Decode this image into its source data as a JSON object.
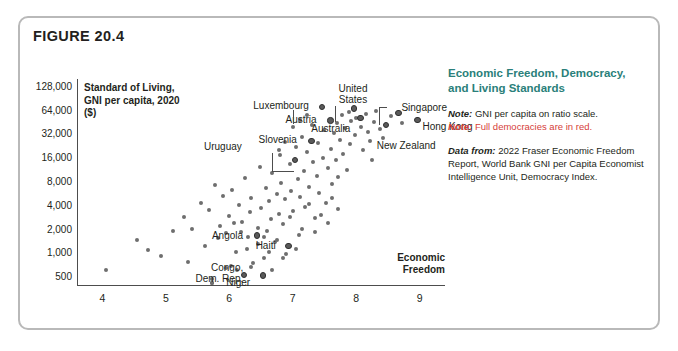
{
  "figure": {
    "label": "FIGURE 20.4"
  },
  "side_panel": {
    "heading": "Economic Freedom, Democracy, and Living Standards",
    "note1_prefix": "Note:",
    "note1_text": " GNI per capita on ratio scale.",
    "note2_prefix": "Note:",
    "note2_text": " Full democracies are in red.",
    "source_prefix": "Data from:",
    "source_text": " 2022 Fraser Economic Freedom Report, World Bank GNI per Capita Economist Intelligence Unit, Democracy Index.",
    "heading_color": "#2a7f7a",
    "red_color": "#d6403a"
  },
  "chart_data": {
    "type": "scatter",
    "title": "Economic Freedom, Democracy, and Living Standards",
    "xlabel": "Economic Freedom",
    "ylabel": "Standard of Living, GNI per capita, 2020 ($)",
    "xlim": [
      3.6,
      9.4
    ],
    "ylim": [
      400,
      160000
    ],
    "yscale": "log",
    "grid": false,
    "legend": null,
    "xticks": [
      4,
      5,
      6,
      7,
      8,
      9
    ],
    "xtick_labels": [
      "4",
      "5",
      "6",
      "7",
      "8",
      "9"
    ],
    "yticks": [
      500,
      1000,
      2000,
      4000,
      8000,
      16000,
      32000,
      64000,
      128000
    ],
    "ytick_labels": [
      "500",
      "1,000",
      "2,000",
      "4,000",
      "8,000",
      "16,000",
      "32,000",
      "64,000",
      "128,000"
    ],
    "point_color": "#6e6e6e",
    "highlight_color": "#2f2f2f",
    "annotations": [
      {
        "label": "Luxembourg",
        "x": 7.45,
        "y": 73000
      },
      {
        "label": "United States",
        "x": 7.95,
        "y": 70000
      },
      {
        "label": "Singapore",
        "x": 8.65,
        "y": 61000
      },
      {
        "label": "Austria",
        "x": 7.58,
        "y": 49000
      },
      {
        "label": "Slovenia",
        "x": 7.28,
        "y": 27000
      },
      {
        "label": "Australia",
        "x": 8.05,
        "y": 53000
      },
      {
        "label": "Hong Kong",
        "x": 8.95,
        "y": 50000
      },
      {
        "label": "Uruguay",
        "x": 7.02,
        "y": 15500
      },
      {
        "label": "New Zealand",
        "x": 8.45,
        "y": 43000
      },
      {
        "label": "Angola",
        "x": 6.42,
        "y": 1740
      },
      {
        "label": "Haiti",
        "x": 6.92,
        "y": 1280
      },
      {
        "label": "Congo, Dem. Rep.",
        "x": 6.22,
        "y": 550
      },
      {
        "label": "Niger",
        "x": 6.52,
        "y": 540
      }
    ],
    "points": [
      {
        "x": 4.05,
        "y": 620
      },
      {
        "x": 4.55,
        "y": 1500
      },
      {
        "x": 4.92,
        "y": 930
      },
      {
        "x": 5.28,
        "y": 2900
      },
      {
        "x": 5.42,
        "y": 2050
      },
      {
        "x": 5.55,
        "y": 4400
      },
      {
        "x": 5.62,
        "y": 1250
      },
      {
        "x": 5.68,
        "y": 3500
      },
      {
        "x": 5.72,
        "y": 430
      },
      {
        "x": 5.78,
        "y": 7400
      },
      {
        "x": 5.85,
        "y": 2250
      },
      {
        "x": 5.9,
        "y": 5400
      },
      {
        "x": 5.95,
        "y": 1800
      },
      {
        "x": 6.0,
        "y": 3000
      },
      {
        "x": 6.05,
        "y": 6300
      },
      {
        "x": 6.1,
        "y": 1050
      },
      {
        "x": 6.15,
        "y": 4100
      },
      {
        "x": 6.2,
        "y": 2500
      },
      {
        "x": 6.25,
        "y": 9000
      },
      {
        "x": 6.3,
        "y": 1600
      },
      {
        "x": 6.32,
        "y": 3300
      },
      {
        "x": 6.35,
        "y": 5000
      },
      {
        "x": 6.38,
        "y": 760
      },
      {
        "x": 6.45,
        "y": 2100
      },
      {
        "x": 6.48,
        "y": 12500
      },
      {
        "x": 6.5,
        "y": 3800
      },
      {
        "x": 6.55,
        "y": 880
      },
      {
        "x": 6.58,
        "y": 6800
      },
      {
        "x": 6.6,
        "y": 1950
      },
      {
        "x": 6.62,
        "y": 4600
      },
      {
        "x": 6.65,
        "y": 2700
      },
      {
        "x": 6.68,
        "y": 10500
      },
      {
        "x": 6.72,
        "y": 1400
      },
      {
        "x": 6.75,
        "y": 5600
      },
      {
        "x": 6.78,
        "y": 3200
      },
      {
        "x": 6.8,
        "y": 17500
      },
      {
        "x": 6.82,
        "y": 7800
      },
      {
        "x": 6.85,
        "y": 2350
      },
      {
        "x": 6.88,
        "y": 4900
      },
      {
        "x": 6.9,
        "y": 990
      },
      {
        "x": 6.95,
        "y": 13500
      },
      {
        "x": 6.98,
        "y": 6100
      },
      {
        "x": 7.0,
        "y": 3400
      },
      {
        "x": 7.05,
        "y": 22000
      },
      {
        "x": 7.08,
        "y": 8800
      },
      {
        "x": 7.1,
        "y": 1700
      },
      {
        "x": 7.12,
        "y": 5200
      },
      {
        "x": 7.15,
        "y": 30000
      },
      {
        "x": 7.18,
        "y": 11000
      },
      {
        "x": 7.2,
        "y": 3900
      },
      {
        "x": 7.22,
        "y": 19000
      },
      {
        "x": 7.25,
        "y": 7000
      },
      {
        "x": 7.3,
        "y": 42000
      },
      {
        "x": 7.32,
        "y": 14500
      },
      {
        "x": 7.35,
        "y": 2800
      },
      {
        "x": 7.38,
        "y": 9500
      },
      {
        "x": 7.4,
        "y": 25000
      },
      {
        "x": 7.42,
        "y": 5800
      },
      {
        "x": 7.45,
        "y": 73000
      },
      {
        "x": 7.48,
        "y": 16000
      },
      {
        "x": 7.5,
        "y": 36000
      },
      {
        "x": 7.52,
        "y": 4300
      },
      {
        "x": 7.55,
        "y": 12000
      },
      {
        "x": 7.58,
        "y": 49000
      },
      {
        "x": 7.6,
        "y": 21000
      },
      {
        "x": 7.62,
        "y": 7600
      },
      {
        "x": 7.65,
        "y": 33000
      },
      {
        "x": 7.68,
        "y": 15000
      },
      {
        "x": 7.7,
        "y": 45000
      },
      {
        "x": 7.72,
        "y": 9200
      },
      {
        "x": 7.75,
        "y": 27000
      },
      {
        "x": 7.78,
        "y": 56000
      },
      {
        "x": 7.8,
        "y": 18000
      },
      {
        "x": 7.82,
        "y": 38000
      },
      {
        "x": 7.85,
        "y": 11500
      },
      {
        "x": 7.88,
        "y": 62000
      },
      {
        "x": 7.9,
        "y": 24000
      },
      {
        "x": 7.92,
        "y": 47000
      },
      {
        "x": 7.95,
        "y": 70000
      },
      {
        "x": 7.98,
        "y": 31000
      },
      {
        "x": 8.0,
        "y": 52000
      },
      {
        "x": 8.05,
        "y": 53000
      },
      {
        "x": 8.08,
        "y": 40000
      },
      {
        "x": 8.1,
        "y": 20000
      },
      {
        "x": 8.15,
        "y": 58000
      },
      {
        "x": 8.18,
        "y": 34000
      },
      {
        "x": 8.22,
        "y": 26000
      },
      {
        "x": 8.28,
        "y": 46000
      },
      {
        "x": 8.32,
        "y": 64000
      },
      {
        "x": 8.38,
        "y": 37000
      },
      {
        "x": 8.45,
        "y": 43000
      },
      {
        "x": 8.55,
        "y": 55000
      },
      {
        "x": 8.65,
        "y": 61000
      },
      {
        "x": 8.72,
        "y": 44000
      },
      {
        "x": 8.95,
        "y": 50000
      },
      {
        "x": 5.72,
        "y": 470
      },
      {
        "x": 6.02,
        "y": 700
      },
      {
        "x": 6.22,
        "y": 550
      },
      {
        "x": 6.52,
        "y": 540
      },
      {
        "x": 6.42,
        "y": 1740
      },
      {
        "x": 6.92,
        "y": 1280
      },
      {
        "x": 7.02,
        "y": 15500
      },
      {
        "x": 7.28,
        "y": 27000
      },
      {
        "x": 4.72,
        "y": 1100
      },
      {
        "x": 5.12,
        "y": 1900
      },
      {
        "x": 5.35,
        "y": 780
      },
      {
        "x": 5.95,
        "y": 660
      },
      {
        "x": 6.12,
        "y": 620
      },
      {
        "x": 6.35,
        "y": 680
      },
      {
        "x": 6.68,
        "y": 620
      },
      {
        "x": 6.28,
        "y": 1150
      },
      {
        "x": 6.45,
        "y": 1320
      },
      {
        "x": 6.62,
        "y": 1050
      },
      {
        "x": 6.75,
        "y": 1480
      },
      {
        "x": 6.18,
        "y": 1850
      },
      {
        "x": 6.08,
        "y": 2400
      },
      {
        "x": 5.82,
        "y": 1580
      },
      {
        "x": 6.55,
        "y": 1620
      },
      {
        "x": 6.85,
        "y": 880
      },
      {
        "x": 7.05,
        "y": 1150
      },
      {
        "x": 7.15,
        "y": 2050
      },
      {
        "x": 6.95,
        "y": 2900
      },
      {
        "x": 7.35,
        "y": 1850
      },
      {
        "x": 7.45,
        "y": 3100
      },
      {
        "x": 7.55,
        "y": 2400
      },
      {
        "x": 7.25,
        "y": 4200
      },
      {
        "x": 7.62,
        "y": 5000
      },
      {
        "x": 7.72,
        "y": 3600
      },
      {
        "x": 6.78,
        "y": 20500
      },
      {
        "x": 6.88,
        "y": 25500
      },
      {
        "x": 7.0,
        "y": 40000
      },
      {
        "x": 7.12,
        "y": 48000
      },
      {
        "x": 7.22,
        "y": 56000
      },
      {
        "x": 5.72,
        "y": 430
      },
      {
        "x": 8.42,
        "y": 29000
      },
      {
        "x": 8.25,
        "y": 15000
      }
    ]
  }
}
